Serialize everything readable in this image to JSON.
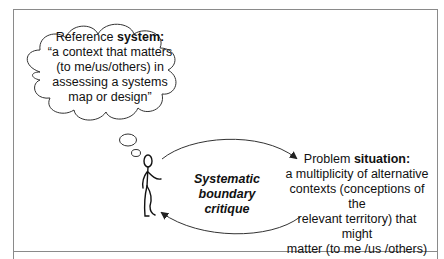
{
  "diagram": {
    "reference_system": {
      "title_prefix": "Reference ",
      "title_bold": "system:",
      "lines": [
        "“a context that matters",
        "(to me/us/others) in",
        "assessing a systems",
        "map or design”"
      ]
    },
    "center": {
      "lines": [
        "Systematic",
        "boundary",
        "critique"
      ]
    },
    "problem_situation": {
      "title_prefix": "Problem ",
      "title_bold": "situation:",
      "lines": [
        "a multiplicity of alternative",
        "contexts (conceptions of the",
        "relevant territory) that might",
        "matter (to me /us /others)"
      ]
    },
    "figure": "stick-figure-thinking",
    "colors": {
      "frame": "#8a8a8a",
      "stroke": "#222222",
      "text": "#111111"
    }
  }
}
